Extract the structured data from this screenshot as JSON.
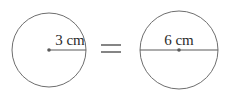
{
  "figure": {
    "type": "geometry-diagram",
    "background_color": "#ffffff",
    "stroke_color": "#6e6e6e",
    "line_color": "#5a5a5a",
    "text_color": "#2b2b2b"
  },
  "left_circle": {
    "name": "circle-radius-3cm",
    "center_x": 49,
    "center_y": 50,
    "radius": 37,
    "measure_type": "radius",
    "label": "3 cm",
    "label_x": 70,
    "label_y": 45,
    "line_x1": 49,
    "line_y1": 50,
    "line_x2": 86,
    "line_y2": 50
  },
  "operator": {
    "name": "equals-sign",
    "symbol": "=",
    "bar_x1": 101,
    "bar_x2": 121,
    "bar_top_y": 45,
    "bar_bottom_y": 52
  },
  "right_circle": {
    "name": "circle-diameter-6cm",
    "center_x": 179,
    "center_y": 50,
    "radius": 39,
    "measure_type": "diameter",
    "label": "6 cm",
    "label_x": 179,
    "label_y": 45,
    "line_x1": 140,
    "line_y1": 50,
    "line_x2": 218,
    "line_y2": 50
  }
}
